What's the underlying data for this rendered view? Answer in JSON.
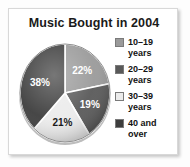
{
  "figure": {
    "background_color": "#ffffff",
    "frame_border_color": "#d8d8d8"
  },
  "chart_data": {
    "type": "pie",
    "title": "Music Bought in 2004",
    "xlabel": "",
    "ylabel": "",
    "grid": false,
    "legend_position": "right",
    "units": "percent",
    "start_angle_deg": 0,
    "direction": "clockwise",
    "categories": [
      "10–19 years",
      "20–29 years",
      "30–39 years",
      "40 and over"
    ],
    "values": [
      22,
      19,
      21,
      38
    ],
    "value_labels": [
      "22%",
      "19%",
      "21%",
      "38%"
    ],
    "colors": [
      "#9a9a9a",
      "#595959",
      "#ebebeb",
      "#3d3d3d"
    ],
    "label_text_colors": [
      "#ffffff",
      "#ffffff",
      "#1a1a1a",
      "#ffffff"
    ],
    "slices": [
      {
        "category": "10–19 years",
        "value": 22,
        "label": "22%",
        "color": "#9a9a9a",
        "label_color": "#ffffff",
        "start_deg": 0,
        "end_deg": 79.2
      },
      {
        "category": "20–29 years",
        "value": 19,
        "label": "19%",
        "color": "#595959",
        "label_color": "#ffffff",
        "start_deg": 79.2,
        "end_deg": 147.6
      },
      {
        "category": "30–39 years",
        "value": 21,
        "label": "21%",
        "color": "#ebebeb",
        "label_color": "#1a1a1a",
        "start_deg": 147.6,
        "end_deg": 223.2
      },
      {
        "category": "40 and over",
        "value": 38,
        "label": "38%",
        "color": "#3d3d3d",
        "label_color": "#ffffff",
        "start_deg": 223.2,
        "end_deg": 360
      }
    ]
  },
  "legend": {
    "items": [
      {
        "label": "10–19\nyears",
        "swatch_color": "#9a9a9a"
      },
      {
        "label": "20–29\nyears",
        "swatch_color": "#595959"
      },
      {
        "label": "30–39\nyears",
        "swatch_color": "#ebebeb"
      },
      {
        "label": "40 and\nover",
        "swatch_color": "#3d3d3d"
      }
    ]
  }
}
